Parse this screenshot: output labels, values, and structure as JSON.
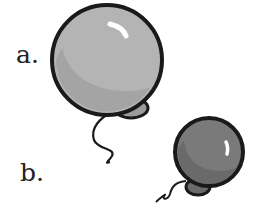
{
  "options": [
    {
      "label": "a.",
      "description": "large light gray balloon"
    },
    {
      "label": "b.",
      "description": "small dark gray balloon"
    }
  ],
  "colors": {
    "balloon_a_fill": "#b4b4b4",
    "balloon_a_shade": "#9a9a9a",
    "balloon_b_fill": "#7a7a7a",
    "balloon_b_shade": "#5f5f5f",
    "outline": "#1a1a1a",
    "highlight": "#ffffff"
  }
}
